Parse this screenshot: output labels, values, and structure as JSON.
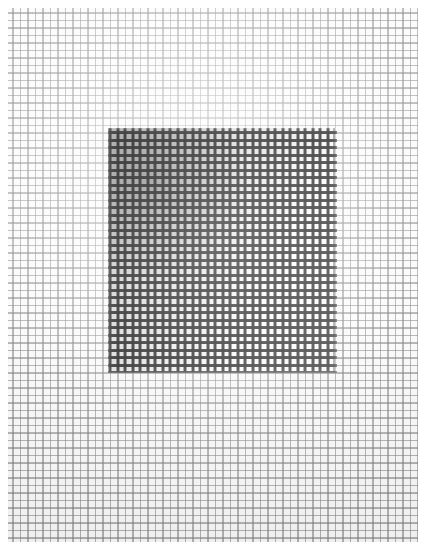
{
  "scene": {
    "subject": "woven wire mesh screen with a darker rectangular patch",
    "canvas": {
      "width": 432,
      "height": 557,
      "background": "#ffffff"
    },
    "mesh_field": {
      "name": "background woven mesh",
      "left": 8,
      "top": 8,
      "width": 410,
      "height": 534,
      "cell_pitch": 7.5,
      "thread_color": "#787878",
      "gap_color": "#fbfbfb",
      "tone": "pale grey, lightest near upper-centre, slightly darker toward the lower and outer edges"
    },
    "dark_patch": {
      "name": "dark rectangular patch",
      "left": 108,
      "top": 128,
      "width": 229,
      "height": 245,
      "cell_pitch": 7.5,
      "thread_color": "#262626",
      "tone": "darkest at the upper-left corner, gradually lighter toward the right and bottom edges"
    },
    "margins": {
      "left": 8,
      "top": 8,
      "right": 14,
      "bottom": 15,
      "color": "#ffffff"
    }
  }
}
